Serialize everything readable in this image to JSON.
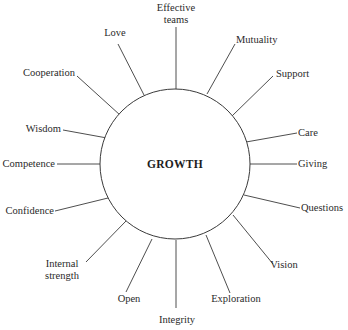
{
  "diagram": {
    "type": "radial-concept-map",
    "center": {
      "label": "GROWTH",
      "cx": 175,
      "cy": 164,
      "r": 75
    },
    "colors": {
      "line": "#3a3a3a",
      "text": "#2a2a2a",
      "background": "#ffffff"
    },
    "spokes": [
      {
        "id": "effective-teams",
        "lines": [
          "Effective",
          "teams"
        ],
        "x1": 176,
        "y1": 89,
        "x2": 176,
        "y2": 27,
        "tx": 176,
        "ty": 11,
        "anchor": "middle"
      },
      {
        "id": "love",
        "lines": [
          "Love"
        ],
        "x1": 144,
        "y1": 95,
        "x2": 118,
        "y2": 44,
        "tx": 115,
        "ty": 36,
        "anchor": "middle"
      },
      {
        "id": "mutuality",
        "lines": [
          "Mutuality"
        ],
        "x1": 207,
        "y1": 94,
        "x2": 235,
        "y2": 44,
        "tx": 236,
        "ty": 43,
        "anchor": "start"
      },
      {
        "id": "cooperation",
        "lines": [
          "Cooperation"
        ],
        "x1": 120,
        "y1": 115,
        "x2": 77,
        "y2": 76,
        "tx": 75,
        "ty": 76,
        "anchor": "end"
      },
      {
        "id": "support",
        "lines": [
          "Support"
        ],
        "x1": 232,
        "y1": 116,
        "x2": 273,
        "y2": 76,
        "tx": 276,
        "ty": 77,
        "anchor": "start"
      },
      {
        "id": "wisdom",
        "lines": [
          "Wisdom"
        ],
        "x1": 107,
        "y1": 138,
        "x2": 63,
        "y2": 130,
        "tx": 61,
        "ty": 132,
        "anchor": "end"
      },
      {
        "id": "care",
        "lines": [
          "Care"
        ],
        "x1": 246,
        "y1": 142,
        "x2": 297,
        "y2": 133,
        "tx": 298,
        "ty": 136,
        "anchor": "start"
      },
      {
        "id": "competence",
        "lines": [
          "Competence"
        ],
        "x1": 100,
        "y1": 164,
        "x2": 57,
        "y2": 164,
        "tx": 55,
        "ty": 167,
        "anchor": "end"
      },
      {
        "id": "giving",
        "lines": [
          "Giving"
        ],
        "x1": 250,
        "y1": 164,
        "x2": 297,
        "y2": 164,
        "tx": 298,
        "ty": 167,
        "anchor": "start"
      },
      {
        "id": "confidence",
        "lines": [
          "Confidence"
        ],
        "x1": 108,
        "y1": 198,
        "x2": 55,
        "y2": 211,
        "tx": 54,
        "ty": 214,
        "anchor": "end"
      },
      {
        "id": "questions",
        "lines": [
          "Questions"
        ],
        "x1": 244,
        "y1": 195,
        "x2": 300,
        "y2": 208,
        "tx": 301,
        "ty": 211,
        "anchor": "start"
      },
      {
        "id": "internal-strength",
        "lines": [
          "Internal",
          "strength"
        ],
        "x1": 126,
        "y1": 221,
        "x2": 86,
        "y2": 262,
        "tx": 62,
        "ty": 267,
        "anchor": "middle"
      },
      {
        "id": "vision",
        "lines": [
          "Vision"
        ],
        "x1": 233,
        "y1": 215,
        "x2": 273,
        "y2": 264,
        "tx": 284,
        "ty": 268,
        "anchor": "middle"
      },
      {
        "id": "open",
        "lines": [
          "Open"
        ],
        "x1": 152,
        "y1": 239,
        "x2": 126,
        "y2": 292,
        "tx": 129,
        "ty": 302,
        "anchor": "middle"
      },
      {
        "id": "exploration",
        "lines": [
          "Exploration"
        ],
        "x1": 206,
        "y1": 235,
        "x2": 230,
        "y2": 293,
        "tx": 236,
        "ty": 302,
        "anchor": "middle"
      },
      {
        "id": "integrity",
        "lines": [
          "Integrity"
        ],
        "x1": 176,
        "y1": 240,
        "x2": 176,
        "y2": 308,
        "tx": 177,
        "ty": 323,
        "anchor": "middle"
      }
    ]
  }
}
